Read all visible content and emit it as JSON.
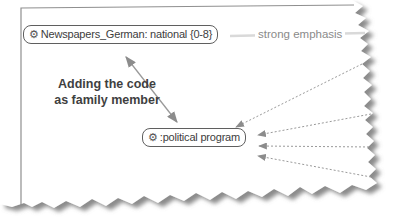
{
  "nodes": {
    "newspapers": {
      "label": "Newspapers_German: national {0-8}"
    },
    "political_program": {
      "label": ":political program"
    }
  },
  "edge": {
    "label": "strong emphasis"
  },
  "annotation": {
    "line1": "Adding the code",
    "line2": "as family member"
  },
  "icons": {
    "code": "⚙"
  },
  "colors": {
    "node_border": "#5f5f5f",
    "node_text": "#3d3d3d",
    "arrow": "#9a9a9a",
    "edge_line": "#d9d9d9",
    "edge_label_text": "#8a8a8a",
    "annotation_text": "#3f3f3f",
    "tear_shadow": "#777777",
    "paper": "#ffffff"
  }
}
